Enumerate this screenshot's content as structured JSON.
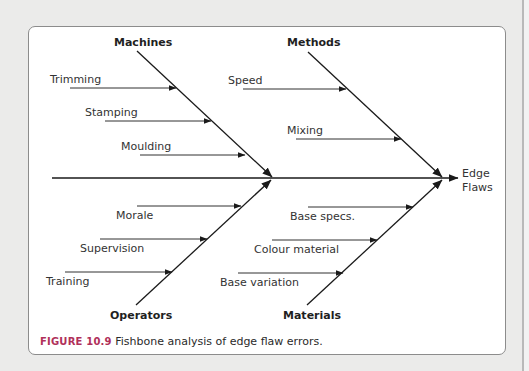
{
  "figure": {
    "number_label": "FIGURE 10.9",
    "caption": "Fishbone analysis of edge flaw errors."
  },
  "diagram": {
    "type": "fishbone",
    "effect": {
      "line1": "Edge",
      "line2": "Flaws"
    },
    "categories": {
      "machines": {
        "label": "Machines",
        "causes": [
          "Trimming",
          "Stamping",
          "Moulding"
        ]
      },
      "methods": {
        "label": "Methods",
        "causes": [
          "Speed",
          "Mixing"
        ]
      },
      "operators": {
        "label": "Operators",
        "causes": [
          "Morale",
          "Supervision",
          "Training"
        ]
      },
      "materials": {
        "label": "Materials",
        "causes": [
          "Base specs.",
          "Colour material",
          "Base variation"
        ]
      }
    }
  },
  "colors": {
    "line": "#1a1a1a",
    "caption_accent": "#b0305a",
    "background": "#ebebea",
    "panel": "#ffffff"
  }
}
